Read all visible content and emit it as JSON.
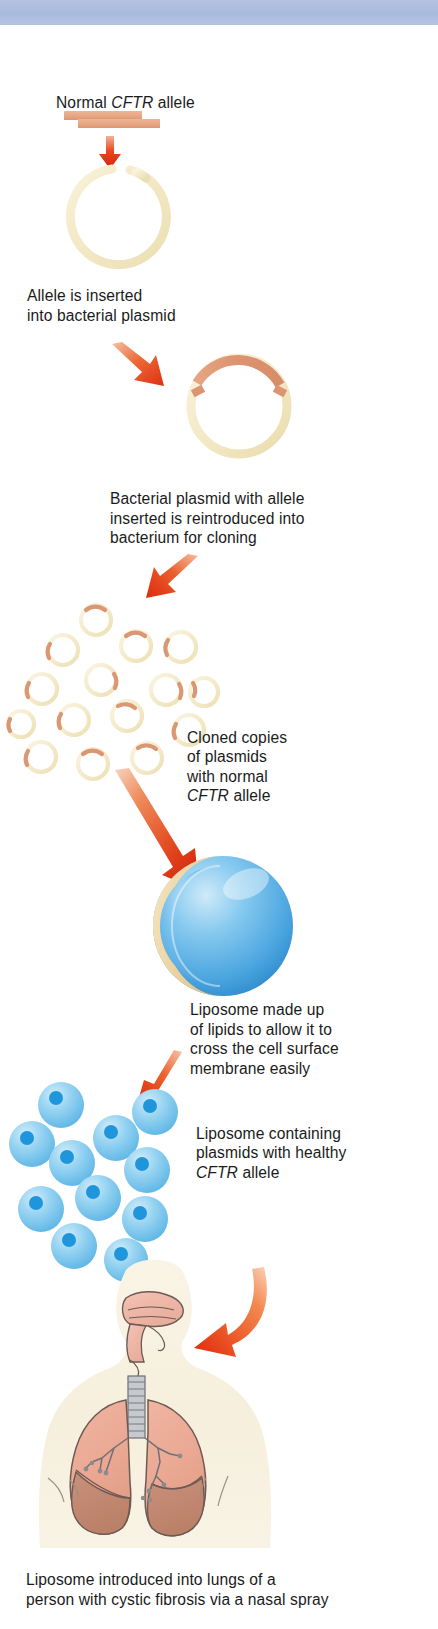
{
  "document": {
    "title": "Gene therapy for cystic fibrosis using liposomes",
    "type": "biology process diagram"
  },
  "banner": {
    "color": "#a9bade",
    "height_px": 25
  },
  "palette": {
    "background": "#ffffff",
    "banner_blue": "#a9bade",
    "plasmid_cream": "#f7edd0",
    "plasmid_cream_dark": "#eadfb5",
    "allele_salmon": "#e8ab8a",
    "allele_salmon_dark": "#d9956f",
    "arrow_red": "#e02b12",
    "arrow_orange": "#f07a45",
    "liposome_blue": "#64b7e8",
    "liposome_blue_dark": "#1f8fd4",
    "liposome_blue_light": "#a8d9f3",
    "lipid_tan": "#ecd5a8",
    "body_cream": "#f7f0df",
    "lung_pink": "#eaa893",
    "lung_pink_dark": "#c08a72",
    "trachea_gray": "#b9bcc0",
    "text_black": "#1b1b1b"
  },
  "steps": [
    {
      "id": "normal-allele",
      "label": "Normal CFTR allele",
      "label_parts": [
        {
          "text": "Normal ",
          "italic": false
        },
        {
          "text": "CFTR",
          "italic": true
        },
        {
          "text": " allele",
          "italic": false
        }
      ],
      "graphic": "dna-fragment-bar"
    },
    {
      "id": "allele-inserted",
      "label": "Allele is inserted\ninto bacterial plasmid",
      "graphic": "open-plasmid-ring"
    },
    {
      "id": "plasmid-reintroduced",
      "label": "Bacterial plasmid with allele\ninserted is reintroduced into\nbacterium for cloning",
      "graphic": "plasmid-with-allele-arc"
    },
    {
      "id": "cloned-copies",
      "label": "Cloned copies\nof plasmids\nwith normal\nCFTR allele",
      "label_parts": [
        {
          "text": "Cloned copies\nof plasmids\nwith normal\n",
          "italic": false
        },
        {
          "text": "CFTR",
          "italic": true
        },
        {
          "text": " allele",
          "italic": false
        }
      ],
      "graphic": "cloned-plasmid-cluster",
      "plasmid_count": 15
    },
    {
      "id": "liposome-lipids",
      "label": "Liposome made up\nof lipids to allow it to\ncross the cell surface\nmembrane easily",
      "graphic": "liposome-cutaway-sphere"
    },
    {
      "id": "liposome-containing",
      "label": "Liposome containing\nplasmids with healthy\nCFTR allele",
      "label_parts": [
        {
          "text": "Liposome containing\nplasmids with healthy\n",
          "italic": false
        },
        {
          "text": "CFTR",
          "italic": true
        },
        {
          "text": " allele",
          "italic": false
        }
      ],
      "graphic": "small-liposome-cluster",
      "liposome_count": 11
    },
    {
      "id": "introduced-lungs",
      "label": "Liposome introduced into lungs of a\nperson with cystic fibrosis via a nasal spray",
      "graphic": "human-torso-lungs"
    }
  ],
  "arrows": [
    {
      "id": "arrow-1",
      "direction": "down",
      "style": "straight",
      "color": "#e02b12"
    },
    {
      "id": "arrow-2",
      "direction": "down-right",
      "style": "straight",
      "color": "#e8512a"
    },
    {
      "id": "arrow-3",
      "direction": "down-left",
      "style": "straight",
      "color": "#e0411f"
    },
    {
      "id": "arrow-4",
      "direction": "down-right",
      "style": "straight-long",
      "color": "#e0411f"
    },
    {
      "id": "arrow-5",
      "direction": "down-left",
      "style": "straight",
      "color": "#e8401b"
    },
    {
      "id": "arrow-6",
      "direction": "down-left",
      "style": "curved",
      "color": "#ef5b23"
    }
  ]
}
